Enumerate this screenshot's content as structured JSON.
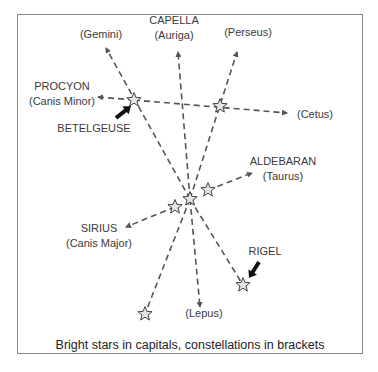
{
  "caption": "Bright stars in capitals, constellations in brackets",
  "colors": {
    "line": "#555555",
    "star_fill": "#e4e4e4",
    "star_stroke": "#444444",
    "text": "#3a3a3a",
    "frame": "#8a8a8a"
  },
  "stars": [
    {
      "id": "betelgeuse",
      "x": 134,
      "y": 100
    },
    {
      "id": "bellatrix",
      "x": 220,
      "y": 106
    },
    {
      "id": "belt-east",
      "x": 208,
      "y": 190
    },
    {
      "id": "belt-middle",
      "x": 190,
      "y": 199
    },
    {
      "id": "belt-west",
      "x": 175,
      "y": 207
    },
    {
      "id": "saiph",
      "x": 145,
      "y": 314
    },
    {
      "id": "rigel",
      "x": 243,
      "y": 285
    }
  ],
  "lines": [
    {
      "from": [
        190,
        199
      ],
      "to": [
        106,
        48
      ],
      "arrow": true
    },
    {
      "from": [
        190,
        199
      ],
      "to": [
        178,
        52
      ],
      "arrow": true
    },
    {
      "from": [
        190,
        199
      ],
      "to": [
        237,
        52
      ],
      "arrow": true
    },
    {
      "from": [
        134,
        100
      ],
      "to": [
        98,
        97
      ],
      "arrow": true
    },
    {
      "from": [
        134,
        100
      ],
      "to": [
        287,
        113
      ],
      "arrow": true
    },
    {
      "from": [
        208,
        190
      ],
      "to": [
        252,
        173
      ],
      "arrow": true
    },
    {
      "from": [
        175,
        207
      ],
      "to": [
        126,
        227
      ],
      "arrow": true
    },
    {
      "from": [
        190,
        199
      ],
      "to": [
        200,
        307
      ],
      "arrow": true
    },
    {
      "from": [
        190,
        199
      ],
      "to": [
        145,
        314
      ],
      "arrow": false
    },
    {
      "from": [
        190,
        199
      ],
      "to": [
        243,
        285
      ],
      "arrow": false
    }
  ],
  "labels": [
    {
      "name": "label-gemini",
      "lines": [
        "(Gemini)"
      ],
      "x": 101,
      "y": 38
    },
    {
      "name": "label-capella",
      "lines": [
        "CAPELLA",
        "(Auriga)"
      ],
      "x": 174,
      "y": 24
    },
    {
      "name": "label-perseus",
      "lines": [
        "(Perseus)"
      ],
      "x": 248,
      "y": 36
    },
    {
      "name": "label-procyon",
      "lines": [
        "PROCYON",
        "(Canis Minor)"
      ],
      "x": 62,
      "y": 90
    },
    {
      "name": "label-betelgeuse",
      "lines": [
        "BETELGEUSE"
      ],
      "x": 94,
      "y": 132
    },
    {
      "name": "label-cetus",
      "lines": [
        "(Cetus)"
      ],
      "x": 315,
      "y": 118
    },
    {
      "name": "label-aldebaran",
      "lines": [
        "ALDEBARAN",
        "(Taurus)"
      ],
      "x": 283,
      "y": 165
    },
    {
      "name": "label-sirius",
      "lines": [
        "SIRIUS",
        "(Canis Major)"
      ],
      "x": 99,
      "y": 232
    },
    {
      "name": "label-rigel",
      "lines": [
        "RIGEL"
      ],
      "x": 265,
      "y": 255
    },
    {
      "name": "label-lepus",
      "lines": [
        "(Lepus)"
      ],
      "x": 204,
      "y": 317
    }
  ],
  "pointers": [
    {
      "name": "betelgeuse-pointer",
      "from": [
        116,
        118
      ],
      "to": [
        131,
        106
      ]
    },
    {
      "name": "rigel-pointer",
      "from": [
        259,
        262
      ],
      "to": [
        249,
        278
      ]
    }
  ]
}
